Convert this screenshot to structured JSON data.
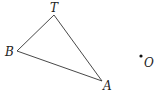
{
  "diagram": {
    "triangle": {
      "vertices": [
        {
          "label": "T",
          "x": 54,
          "y": 15
        },
        {
          "label": "B",
          "x": 17,
          "y": 51
        },
        {
          "label": "A",
          "x": 102,
          "y": 81
        }
      ]
    },
    "point": {
      "label": "O",
      "x": 141,
      "y": 56
    }
  },
  "labels": {
    "T": "T",
    "B": "B",
    "A": "A",
    "O": "O"
  },
  "colors": {
    "stroke": "#333333",
    "text": "#222222"
  }
}
